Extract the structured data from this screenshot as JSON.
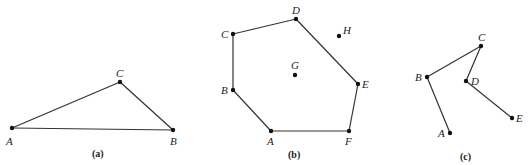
{
  "figures": [
    {
      "caption": "(a)",
      "caption_pos": [
        92,
        157
      ],
      "points": [
        {
          "label": "A",
          "x": 12,
          "y": 128,
          "lx": 6,
          "ly": 145
        },
        {
          "label": "C",
          "x": 120,
          "y": 82,
          "lx": 116,
          "ly": 77
        },
        {
          "label": "B",
          "x": 173,
          "y": 130,
          "lx": 170,
          "ly": 145
        }
      ],
      "edges": [
        [
          "A",
          "C"
        ],
        [
          "C",
          "B"
        ],
        [
          "A",
          "B"
        ]
      ]
    },
    {
      "caption": "(b)",
      "caption_pos": [
        288,
        158
      ],
      "points": [
        {
          "label": "A",
          "x": 271,
          "y": 131,
          "lx": 267,
          "ly": 145
        },
        {
          "label": "B",
          "x": 233,
          "y": 90,
          "lx": 221,
          "ly": 94
        },
        {
          "label": "C",
          "x": 233,
          "y": 34,
          "lx": 221,
          "ly": 38
        },
        {
          "label": "D",
          "x": 296,
          "y": 19,
          "lx": 292,
          "ly": 14
        },
        {
          "label": "E",
          "x": 358,
          "y": 84,
          "lx": 362,
          "ly": 88
        },
        {
          "label": "F",
          "x": 349,
          "y": 131,
          "lx": 345,
          "ly": 145
        },
        {
          "label": "G",
          "x": 295,
          "y": 75,
          "lx": 291,
          "ly": 69
        },
        {
          "label": "H",
          "x": 339,
          "y": 36,
          "lx": 343,
          "ly": 34
        }
      ],
      "edges": [
        [
          "A",
          "B"
        ],
        [
          "B",
          "C"
        ],
        [
          "C",
          "D"
        ],
        [
          "D",
          "E"
        ],
        [
          "E",
          "F"
        ],
        [
          "F",
          "A"
        ]
      ]
    },
    {
      "caption": "(c)",
      "caption_pos": [
        460,
        160
      ],
      "points": [
        {
          "label": "A",
          "x": 450,
          "y": 133,
          "lx": 438,
          "ly": 137
        },
        {
          "label": "B",
          "x": 427,
          "y": 77,
          "lx": 415,
          "ly": 81
        },
        {
          "label": "C",
          "x": 481,
          "y": 46,
          "lx": 478,
          "ly": 41
        },
        {
          "label": "D",
          "x": 466,
          "y": 81,
          "lx": 471,
          "ly": 85
        },
        {
          "label": "E",
          "x": 512,
          "y": 118,
          "lx": 516,
          "ly": 122
        }
      ],
      "edges": [
        [
          "A",
          "B"
        ],
        [
          "B",
          "C"
        ],
        [
          "C",
          "D"
        ],
        [
          "D",
          "E"
        ]
      ]
    }
  ]
}
